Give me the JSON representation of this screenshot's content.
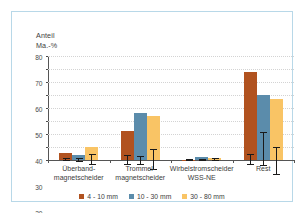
{
  "chart_data": {
    "type": "bar",
    "title": "",
    "subtitle": "",
    "xlabel": "",
    "ylabel": "Anteil Ma.-%",
    "ylabel_lines": [
      "Anteil",
      "Ma.-%"
    ],
    "ylim": [
      0,
      80
    ],
    "ytick_values": [
      0,
      10,
      20,
      30,
      40,
      50,
      60,
      70,
      80
    ],
    "ytick_labels": [
      "0",
      "10",
      "20",
      "30",
      "40",
      "50",
      "60",
      "70",
      "80"
    ],
    "grid": "horizontal-dotted",
    "legend_position": "bottom-center",
    "categories": [
      "Überband-\nmagnetscheider",
      "Trommel-\nmagnetscheider",
      "Wirbelstromscheider\nWSS-NE",
      "Rest"
    ],
    "category_lines": [
      [
        "Überband-",
        "magnetscheider"
      ],
      [
        "Trommel-",
        "magnetscheider"
      ],
      [
        "Wirbelstromscheider",
        "WSS-NE"
      ],
      [
        "Rest"
      ]
    ],
    "series": [
      {
        "name": "4 - 10 mm",
        "color": "#b1521f",
        "values": [
          5.5,
          22.0,
          0.3,
          68.0
        ],
        "err_low": [
          4.8,
          18.5,
          0.2,
          64.5
        ],
        "err_high": [
          6.3,
          25.5,
          0.5,
          72.0
        ]
      },
      {
        "name": "10 - 30 mm",
        "color": "#5b8cab",
        "values": [
          3.5,
          36.0,
          2.5,
          50.0
        ],
        "err_low": [
          2.2,
          32.5,
          2.0,
          45.5
        ],
        "err_high": [
          4.8,
          38.5,
          3.2,
          71.5
        ]
      },
      {
        "name": "30 - 80 mm",
        "color": "#f9c465",
        "values": [
          10.0,
          34.0,
          1.5,
          47.0
        ],
        "err_low": [
          6.5,
          26.5,
          0.8,
          35.5
        ],
        "err_high": [
          14.0,
          42.0,
          3.0,
          56.5
        ]
      }
    ]
  },
  "legend": {
    "items": [
      {
        "label": "4 - 10 mm",
        "color": "#b1521f"
      },
      {
        "label": "10 - 30 mm",
        "color": "#5b8cab"
      },
      {
        "label": "30 - 80 mm",
        "color": "#f9c465"
      }
    ]
  },
  "frame": {
    "border_color": "#b8d8e8",
    "background": "#ffffff"
  }
}
